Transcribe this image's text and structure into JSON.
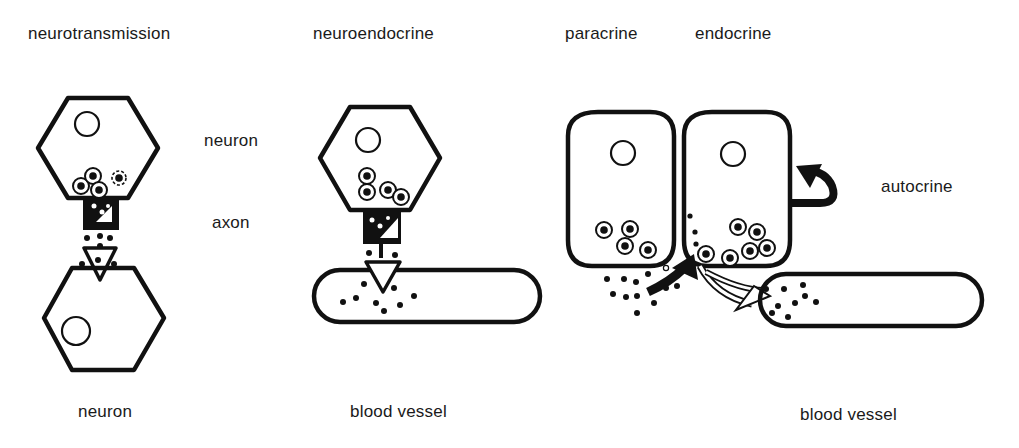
{
  "titles": {
    "neurotransmission": "neurotransmission",
    "neuroendocrine": "neuroendocrine",
    "paracrine": "paracrine",
    "endocrine": "endocrine"
  },
  "labels": {
    "neuron_top": "neuron",
    "axon": "axon",
    "neuron_bottom": "neuron",
    "blood_vessel_middle": "blood vessel",
    "autocrine": "autocrine",
    "blood_vessel_right": "blood vessel"
  },
  "colors": {
    "ink": "#111111",
    "background": "#ffffff"
  }
}
